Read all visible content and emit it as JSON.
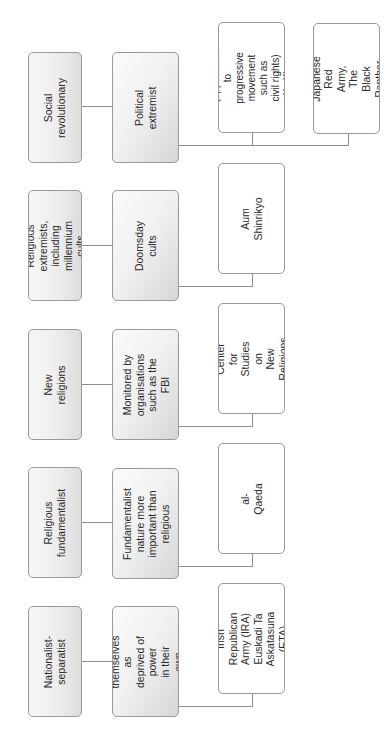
{
  "diagram": {
    "orientation": "rotated 90 degrees counter-clockwise",
    "colors": {
      "border": "#9a9a9a",
      "connector": "#8f8f8f",
      "box_gradient_light": "#f7f7f7",
      "box_gradient_dark": "#d6d6d6",
      "leaf_background": "#ffffff"
    },
    "branches": [
      {
        "category": "Social revolutionary",
        "description": "Political\nextremist",
        "examples": [
          "Right-wing\n(opposition to\nprogressive movement\nsuch as civil rights)\nKu Klux Klan",
          "Left wing, Japanese\nRed Army,\nThe Black\nPanther Army"
        ]
      },
      {
        "category": "Religious\nextremists, including\nmillennium cults",
        "description": "Doomsday cults",
        "examples": [
          "Aum Shinrikyo"
        ]
      },
      {
        "category": "New religions",
        "description": "Monitored by\norganisations\nsuch as the FBI",
        "examples": [
          "Center for\nStudies on\nNew Religions"
        ]
      },
      {
        "category": "Religious\nfundamentalist",
        "description": "Fundamentalist\nnature more\nimportant than\nreligious",
        "examples": [
          "al-Qaeda"
        ]
      },
      {
        "category": "Nationalist-separatist",
        "description": "Perceive themselves\nas deprived of power\nin their own homeland",
        "examples": [
          "Irish Republican\nArmy (IRA)\nEuskadi Ta\nAskatasuna (ETA)"
        ]
      }
    ]
  }
}
